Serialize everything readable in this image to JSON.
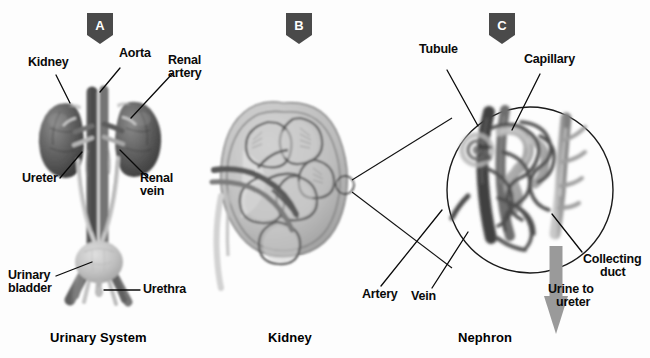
{
  "figure": {
    "background": "#fdfdfd",
    "ink": "#0a0a0a",
    "badge_color": "#4a4a4a",
    "arrow_color": "#9a9a9a"
  },
  "panels": [
    {
      "id": "A",
      "badge": "A",
      "caption": "Urinary System",
      "labels": [
        {
          "key": "kidney",
          "text": "Kidney"
        },
        {
          "key": "aorta",
          "text": "Aorta"
        },
        {
          "key": "renal_artery",
          "text": "Renal\nartery"
        },
        {
          "key": "ureter",
          "text": "Ureter"
        },
        {
          "key": "renal_vein",
          "text": "Renal\nvein"
        },
        {
          "key": "urinary_bladder",
          "text": "Urinary\nbladder"
        },
        {
          "key": "urethra",
          "text": "Urethra"
        }
      ]
    },
    {
      "id": "B",
      "badge": "B",
      "caption": "Kidney",
      "labels": []
    },
    {
      "id": "C",
      "badge": "C",
      "caption": "Nephron",
      "labels": [
        {
          "key": "tubule",
          "text": "Tubule"
        },
        {
          "key": "capillary",
          "text": "Capillary"
        },
        {
          "key": "artery",
          "text": "Artery"
        },
        {
          "key": "vein",
          "text": "Vein"
        },
        {
          "key": "collecting_duct",
          "text": "Collecting\nduct"
        },
        {
          "key": "urine_to_ureter",
          "text": "Urine to\nureter"
        }
      ]
    }
  ],
  "labels": {
    "kidney": "Kidney",
    "aorta": "Aorta",
    "renal_artery_l1": "Renal",
    "renal_artery_l2": "artery",
    "ureter": "Ureter",
    "renal_vein_l1": "Renal",
    "renal_vein_l2": "vein",
    "urinary_bladder_l1": "Urinary",
    "urinary_bladder_l2": "bladder",
    "urethra": "Urethra",
    "tubule": "Tubule",
    "capillary": "Capillary",
    "artery": "Artery",
    "vein": "Vein",
    "collecting_duct_l1": "Collecting",
    "collecting_duct_l2": "duct",
    "urine_l1": "Urine to",
    "urine_l2": "ureter"
  },
  "captions": {
    "a": "Urinary System",
    "b": "Kidney",
    "c": "Nephron"
  },
  "badges": {
    "a": "A",
    "b": "B",
    "c": "C"
  }
}
